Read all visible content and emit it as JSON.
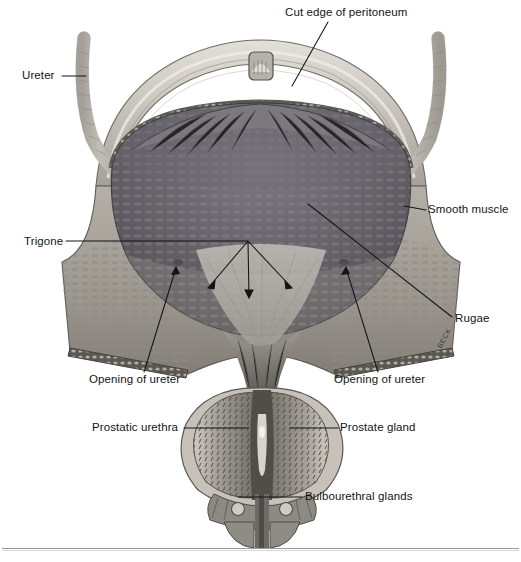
{
  "figure": {
    "artist_signature": "BECK",
    "background": "#ffffff",
    "ink": "#141414"
  },
  "palette": {
    "peritoneum_light": "#d3d0c9",
    "peritoneum_mid": "#b2aea5",
    "bladder_cavity_dark": "#57545a",
    "bladder_cavity_mid": "#6d6a70",
    "mucosa_light": "#b9b5ad",
    "wall_grey": "#8d8a85",
    "wall_edge": "#4a4844",
    "prostate_mid": "#8b877f",
    "prostate_dark": "#55524d",
    "ureter_pale": "#cfccc4",
    "rule": "#9a9a9a"
  },
  "labels": [
    {
      "id": "cut-edge-of-peritoneum",
      "text": "Cut edge of peritoneum",
      "x": 285,
      "y": 7,
      "align": "left"
    },
    {
      "id": "ureter",
      "text": "Ureter",
      "x": 22,
      "y": 70,
      "align": "left"
    },
    {
      "id": "smooth-muscle",
      "text": "Smooth muscle",
      "x": 428,
      "y": 204,
      "align": "left"
    },
    {
      "id": "trigone",
      "text": "Trigone",
      "x": 24,
      "y": 236,
      "align": "left"
    },
    {
      "id": "rugae",
      "text": "Rugae",
      "x": 455,
      "y": 313,
      "align": "left"
    },
    {
      "id": "opening-of-ureter-left",
      "text": "Opening of ureter",
      "x": 89,
      "y": 374,
      "align": "left"
    },
    {
      "id": "opening-of-ureter-right",
      "text": "Opening of ureter",
      "x": 334,
      "y": 374,
      "align": "left"
    },
    {
      "id": "prostatic-urethra",
      "text": "Prostatic urethra",
      "x": 92,
      "y": 422,
      "align": "left"
    },
    {
      "id": "prostate-gland",
      "text": "Prostate gland",
      "x": 340,
      "y": 422,
      "align": "left"
    },
    {
      "id": "bulbourethral-glands",
      "text": "Bulbourethral glands",
      "x": 305,
      "y": 491,
      "align": "left"
    }
  ],
  "structures": [
    {
      "id": "peritoneum-dome",
      "name": "Cut edge of peritoneum"
    },
    {
      "id": "ureter-left",
      "name": "Left ureter"
    },
    {
      "id": "ureter-right",
      "name": "Right ureter"
    },
    {
      "id": "bladder-cavity",
      "name": "Bladder cavity"
    },
    {
      "id": "detrusor-smooth-muscle",
      "name": "Smooth muscle (detrusor)"
    },
    {
      "id": "rugae-folds",
      "name": "Rugae"
    },
    {
      "id": "trigone-region",
      "name": "Trigone"
    },
    {
      "id": "ureteric-orifice-left",
      "name": "Left ureteric opening"
    },
    {
      "id": "ureteric-orifice-right",
      "name": "Right ureteric opening"
    },
    {
      "id": "prostate-gland-body",
      "name": "Prostate gland"
    },
    {
      "id": "prostatic-urethra-lumen",
      "name": "Prostatic urethra"
    },
    {
      "id": "bulbourethral-gland-left",
      "name": "Left bulbourethral gland"
    },
    {
      "id": "bulbourethral-gland-right",
      "name": "Right bulbourethral gland"
    },
    {
      "id": "urachus-remnant",
      "name": "Urachus remnant nub"
    }
  ]
}
